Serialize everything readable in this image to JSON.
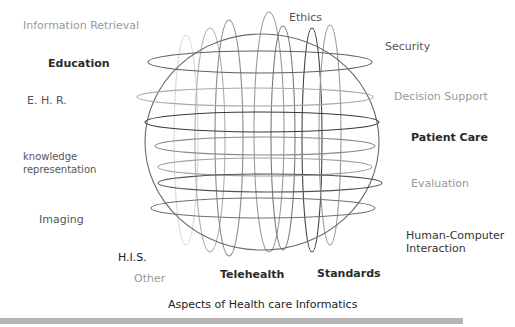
{
  "title": "Aspects of Health care Informatics",
  "labels": {
    "information_retrieval": "Information Retrieval",
    "education": "Education",
    "ehr": "E. H. R.",
    "knowledge_rep_line1": "knowledge",
    "knowledge_rep_line2": "representation",
    "imaging": "Imaging",
    "his": "H.I.S.",
    "other": "Other",
    "telehealth": "Telehealth",
    "standards": "Standards",
    "ethics": "Ethics",
    "security": "Security",
    "decision_support": "Decision Support",
    "patient_care": "Patient Care",
    "evaluation": "Evaluation",
    "hci_line1": "Human-Computer",
    "hci_line2": "Interaction"
  },
  "colors": {
    "dark": "#2a2a2a",
    "mid": "#555555",
    "light": "#999999",
    "bar": "#b5b5b5"
  }
}
